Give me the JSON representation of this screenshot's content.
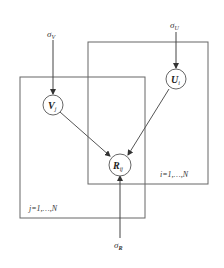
{
  "diagram": {
    "type": "probabilistic graphical model (plate notation)",
    "nodes": {
      "sigma_v": {
        "label": "σ",
        "sub": "V"
      },
      "sigma_u": {
        "label": "σ",
        "sub": "U"
      },
      "sigma_r": {
        "label": "σ",
        "sub": "R"
      },
      "v": {
        "label": "V",
        "sub": "j"
      },
      "u": {
        "label": "U",
        "sub": "i"
      },
      "r": {
        "label": "R",
        "sub": "ij"
      }
    },
    "plates": {
      "j_plate": {
        "label": "j=1,…,N"
      },
      "i_plate": {
        "label": "i=1,…,N"
      }
    },
    "edges": [
      {
        "from": "sigma_v",
        "to": "v"
      },
      {
        "from": "sigma_u",
        "to": "u"
      },
      {
        "from": "v",
        "to": "r"
      },
      {
        "from": "u",
        "to": "r"
      },
      {
        "from": "sigma_r",
        "to": "r"
      }
    ],
    "colors": {
      "line": "#555555",
      "text": "#333333",
      "background": "#ffffff"
    }
  }
}
